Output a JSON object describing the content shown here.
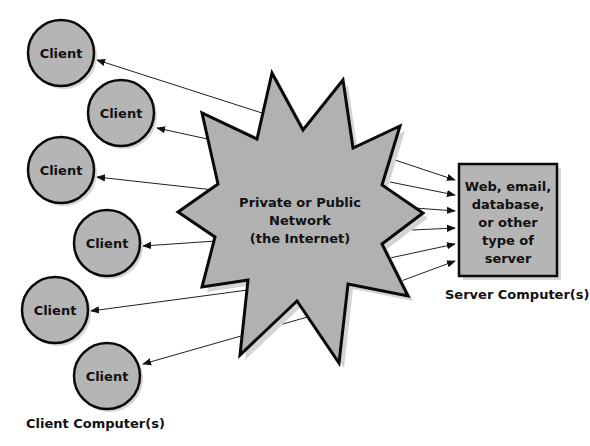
{
  "colors": {
    "fill": "#b1b1b1",
    "stroke": "#0a0a0a",
    "shadow": "#cfcfcf",
    "line": "#222222",
    "background": "#ffffff"
  },
  "network": {
    "line1": "Private or Public",
    "line2": "Network",
    "line3": "(the Internet)",
    "icon": "starburst-network-icon"
  },
  "clients": [
    {
      "label": "Client"
    },
    {
      "label": "Client"
    },
    {
      "label": "Client"
    },
    {
      "label": "Client"
    },
    {
      "label": "Client"
    },
    {
      "label": "Client"
    }
  ],
  "clients_caption": "Client Computer(s)",
  "server": {
    "lines": [
      "Web, email,",
      "database,",
      "or other",
      "type of",
      "server"
    ],
    "caption": "Server Computer(s)"
  }
}
